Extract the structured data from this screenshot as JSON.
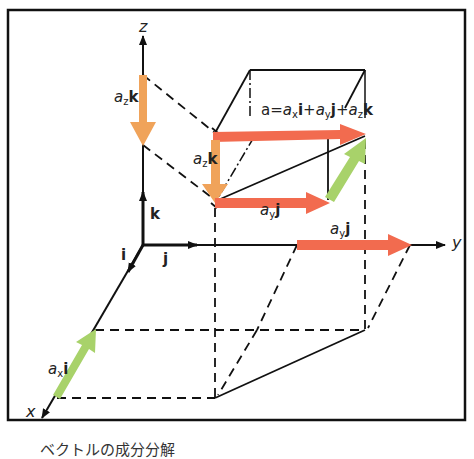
{
  "diagram": {
    "type": "3d-vector-decomposition",
    "axes": {
      "x_label": "x",
      "y_label": "y",
      "z_label": "z"
    },
    "unit_vectors": {
      "i_label": "i",
      "j_label": "j",
      "k_label": "k"
    },
    "components": {
      "ax_coef": "a",
      "ax_sub": "x",
      "ax_unit": "i",
      "ay_coef": "a",
      "ay_sub": "y",
      "ay_unit": "j",
      "az_coef": "a",
      "az_sub": "z",
      "az_unit": "k"
    },
    "equation": {
      "lhs": "a",
      "eq": "=",
      "t1_coef": "a",
      "t1_sub": "x",
      "t1_unit": "i",
      "plus1": "+",
      "t2_coef": "a",
      "t2_sub": "y",
      "t2_unit": "j",
      "plus2": "+",
      "t3_coef": "a",
      "t3_sub": "z",
      "t3_unit": "k"
    },
    "colors": {
      "x_component": "#a8d26a",
      "y_component": "#f26b4f",
      "z_component": "#f0a35a",
      "resultant": "#f26b4f",
      "lines": "#111111"
    },
    "caption": "ベクトルの成分分解"
  }
}
